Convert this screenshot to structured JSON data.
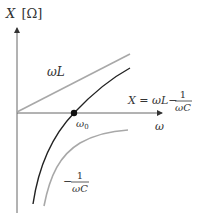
{
  "diagram": {
    "y_axis_label": {
      "var": "X",
      "unit": "[Ω]"
    },
    "x_axis_label": "ω",
    "curves": [
      {
        "name": "inductive-reactance",
        "label": "ωL",
        "color": "#a8a8a8"
      },
      {
        "name": "total-reactance",
        "label_lhs": "X = ωL−",
        "label_num": "1",
        "label_den": "ωC",
        "color": "#222222"
      },
      {
        "name": "capacitive-reactance",
        "label_sign": "−",
        "label_num": "1",
        "label_den": "ωC",
        "color": "#a8a8a8"
      }
    ],
    "resonance_point": {
      "label": "ω",
      "subscript": "0"
    },
    "colors": {
      "axis": "#555555",
      "gray_curve": "#a8a8a8",
      "black_curve": "#222222"
    }
  }
}
